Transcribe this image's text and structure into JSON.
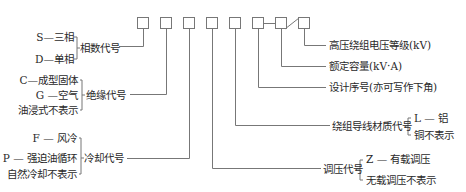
{
  "diagram": {
    "title_boxes_count": 8,
    "colors": {
      "line": "#777777",
      "text": "#2a2a2a",
      "background": "#ffffff"
    },
    "left": {
      "phase": {
        "options": [
          "S—三相",
          "D—单相"
        ],
        "label": "相数代号"
      },
      "insulation": {
        "options": [
          "C—成型固体",
          "G —空气",
          "油浸式不表示"
        ],
        "label": "绝缘代号"
      },
      "cooling": {
        "options": [
          "F — 风冷",
          "P — 强迫油循环",
          "自然冷却不表示"
        ],
        "label": "冷却代号"
      }
    },
    "right": {
      "hv_voltage": {
        "label": "高压绕组电压等级(kV)"
      },
      "rated_capacity": {
        "label": "额定容量(kV·A)"
      },
      "design_no": {
        "label": "设计序号(亦可写作下角)"
      },
      "conductor": {
        "label": "绕组导线材质代号",
        "options": [
          "L — 铝",
          "铜不表示"
        ]
      },
      "tap_changer": {
        "label": "调压代号",
        "options": [
          "Z — 有载调压",
          "无载调压不表示"
        ]
      }
    }
  }
}
